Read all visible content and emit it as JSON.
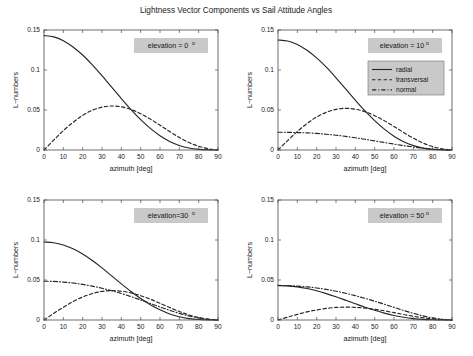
{
  "chart_data": {
    "type": "line",
    "title": "Lightness Vector Components vs Sail Attitude Angles",
    "layout": {
      "rows": 2,
      "cols": 2,
      "grid": true,
      "background": "#ffffff"
    },
    "shared": {
      "xlabel": "azimuth [deg]",
      "ylabel": "L−numbers",
      "xlim": [
        0,
        90
      ],
      "ylim": [
        0,
        0.15
      ],
      "xticks": [
        0,
        10,
        20,
        30,
        40,
        50,
        60,
        70,
        80,
        90
      ],
      "yticks": [
        0,
        0.05,
        0.1,
        0.15
      ],
      "xticklabels": [
        "0",
        "10",
        "20",
        "30",
        "40",
        "50",
        "60",
        "70",
        "80",
        "90"
      ],
      "yticklabels": [
        "0",
        "0.05",
        "0.1",
        "0.15"
      ],
      "line_color": "#262626",
      "grid_color": "#b9b9b9",
      "annotation_bg": "#c9c9c9"
    },
    "legend": {
      "position": "top-right of panel 2",
      "entries": [
        {
          "label": "radial",
          "style": "solid"
        },
        {
          "label": "transversal",
          "style": "dashed"
        },
        {
          "label": "normal",
          "style": "dashdot"
        }
      ]
    },
    "panels": [
      {
        "id": "panel-elevation-0",
        "annotation": "elevation = 0",
        "annotation_unit": "o",
        "elevation_deg": 0,
        "x": [
          0,
          5,
          10,
          15,
          20,
          25,
          30,
          35,
          40,
          45,
          50,
          55,
          60,
          65,
          70,
          75,
          80,
          85,
          90
        ],
        "series": [
          {
            "name": "radial",
            "style": "solid",
            "values": [
              0.143,
              0.1414,
              0.1366,
              0.1288,
              0.1187,
              0.1065,
              0.0929,
              0.0785,
              0.0643,
              0.0506,
              0.038,
              0.027,
              0.0179,
              0.0107,
              0.0057,
              0.0025,
              0.0008,
              0.0001,
              0.0
            ]
          },
          {
            "name": "transversal",
            "style": "dashed",
            "values": [
              0.0,
              0.0124,
              0.0241,
              0.0345,
              0.0432,
              0.0497,
              0.0536,
              0.055,
              0.0539,
              0.0506,
              0.0453,
              0.0386,
              0.031,
              0.023,
              0.0156,
              0.0093,
              0.0046,
              0.0016,
              0.0
            ]
          }
        ]
      },
      {
        "id": "panel-elevation-10",
        "annotation": "elevation = 10",
        "annotation_unit": "o",
        "elevation_deg": 10,
        "x": [
          0,
          5,
          10,
          15,
          20,
          25,
          30,
          35,
          40,
          45,
          50,
          55,
          60,
          65,
          70,
          75,
          80,
          85,
          90
        ],
        "series": [
          {
            "name": "radial",
            "style": "solid",
            "values": [
              0.1375,
              0.1362,
              0.132,
              0.1248,
              0.1152,
              0.1035,
              0.0903,
              0.0763,
              0.0623,
              0.0489,
              0.0367,
              0.0261,
              0.0173,
              0.0104,
              0.0055,
              0.0024,
              0.0008,
              0.0001,
              0.0
            ]
          },
          {
            "name": "transversal",
            "style": "dashed",
            "values": [
              0.0,
              0.0118,
              0.023,
              0.033,
              0.0412,
              0.0472,
              0.0508,
              0.0521,
              0.051,
              0.0479,
              0.0429,
              0.0366,
              0.0294,
              0.0219,
              0.0148,
              0.0088,
              0.0043,
              0.0015,
              0.0
            ]
          },
          {
            "name": "normal",
            "style": "dashdot",
            "values": [
              0.0222,
              0.0221,
              0.0218,
              0.0214,
              0.0207,
              0.0197,
              0.0185,
              0.017,
              0.0153,
              0.0134,
              0.0114,
              0.0094,
              0.0074,
              0.0055,
              0.0038,
              0.0023,
              0.0012,
              0.0004,
              0.0
            ]
          }
        ]
      },
      {
        "id": "panel-elevation-30",
        "annotation": "elevation=30",
        "annotation_unit": "o",
        "elevation_deg": 30,
        "x": [
          0,
          5,
          10,
          15,
          20,
          25,
          30,
          35,
          40,
          45,
          50,
          55,
          60,
          65,
          70,
          75,
          80,
          85,
          90
        ],
        "series": [
          {
            "name": "radial",
            "style": "solid",
            "values": [
              0.0975,
              0.0966,
              0.0938,
              0.089,
              0.0824,
              0.0743,
              0.0651,
              0.0552,
              0.0452,
              0.0356,
              0.0268,
              0.0191,
              0.0127,
              0.0076,
              0.004,
              0.0018,
              0.0006,
              0.0001,
              0.0
            ]
          },
          {
            "name": "transversal",
            "style": "dashed",
            "values": [
              0.0,
              0.0082,
              0.016,
              0.023,
              0.0288,
              0.0331,
              0.0357,
              0.0367,
              0.036,
              0.0339,
              0.0304,
              0.026,
              0.0209,
              0.0156,
              0.0106,
              0.0063,
              0.0031,
              0.0011,
              0.0
            ]
          },
          {
            "name": "normal",
            "style": "dashdot",
            "values": [
              0.0485,
              0.0482,
              0.0474,
              0.0462,
              0.0445,
              0.0423,
              0.0397,
              0.0366,
              0.0331,
              0.0292,
              0.025,
              0.0207,
              0.0163,
              0.0121,
              0.0083,
              0.0051,
              0.0026,
              0.0009,
              0.0
            ]
          }
        ]
      },
      {
        "id": "panel-elevation-50",
        "annotation": "elevation = 50",
        "annotation_unit": "o",
        "elevation_deg": 50,
        "x": [
          0,
          5,
          10,
          15,
          20,
          25,
          30,
          35,
          40,
          45,
          50,
          55,
          60,
          65,
          70,
          75,
          80,
          85,
          90
        ],
        "series": [
          {
            "name": "radial",
            "style": "solid",
            "values": [
              0.043,
              0.0426,
              0.0414,
              0.0393,
              0.0365,
              0.033,
              0.029,
              0.0247,
              0.0203,
              0.016,
              0.0121,
              0.0086,
              0.0057,
              0.0034,
              0.0018,
              0.0008,
              0.0003,
              0.0,
              0.0
            ]
          },
          {
            "name": "transversal",
            "style": "dashed",
            "values": [
              0.0,
              0.0036,
              0.007,
              0.0101,
              0.0126,
              0.0145,
              0.0157,
              0.0161,
              0.0158,
              0.0149,
              0.0134,
              0.0115,
              0.0092,
              0.0069,
              0.0047,
              0.0028,
              0.0014,
              0.0005,
              0.0
            ]
          },
          {
            "name": "normal",
            "style": "dashdot",
            "values": [
              0.0432,
              0.043,
              0.0424,
              0.0414,
              0.04,
              0.0382,
              0.036,
              0.0334,
              0.0304,
              0.0271,
              0.0235,
              0.0197,
              0.0158,
              0.0119,
              0.0083,
              0.0051,
              0.0026,
              0.0009,
              0.0
            ]
          }
        ]
      }
    ]
  }
}
